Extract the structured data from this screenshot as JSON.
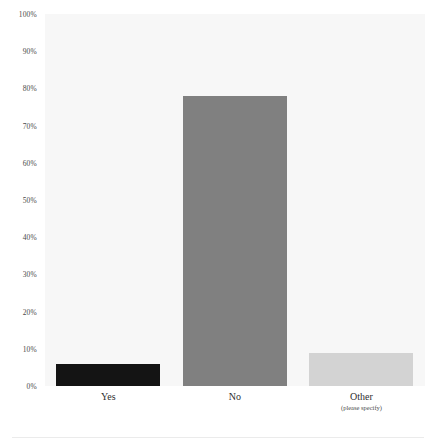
{
  "chart_data": {
    "type": "bar",
    "title": "",
    "subtitle": "",
    "xlabel": "",
    "ylabel": "",
    "categories": [
      "Yes",
      "No",
      "Other"
    ],
    "category_sublabels": [
      "",
      "",
      "(please specify)"
    ],
    "values": [
      6,
      78,
      9
    ],
    "value_labels": [
      "6%",
      "78%",
      "9%"
    ],
    "ylim": [
      0,
      100
    ],
    "ytick_labels": [
      "100%",
      "90%",
      "80%",
      "70%",
      "60%",
      "50%",
      "40%",
      "30%",
      "20%",
      "10%",
      "0%"
    ],
    "ytick_values": [
      100,
      90,
      80,
      70,
      60,
      50,
      40,
      30,
      20,
      10,
      0
    ],
    "grid": false,
    "legend": false,
    "legend_position": "none",
    "bar_colors": [
      "#141414",
      "#808080",
      "#d3d3d3"
    ],
    "plot_background": "#f7f7f7",
    "page_background": "#ffffff"
  },
  "axis": {
    "y_tick_0": "100%",
    "y_tick_1": "90%",
    "y_tick_2": "80%",
    "y_tick_3": "70%",
    "y_tick_4": "60%",
    "y_tick_5": "50%",
    "y_tick_6": "40%",
    "y_tick_7": "30%",
    "y_tick_8": "20%",
    "y_tick_9": "10%",
    "y_tick_10": "0%"
  },
  "categories": {
    "c0_label": "Yes",
    "c0_sublabel": "",
    "c1_label": "No",
    "c1_sublabel": "",
    "c2_label": "Other",
    "c2_sublabel": "(please specify)"
  }
}
